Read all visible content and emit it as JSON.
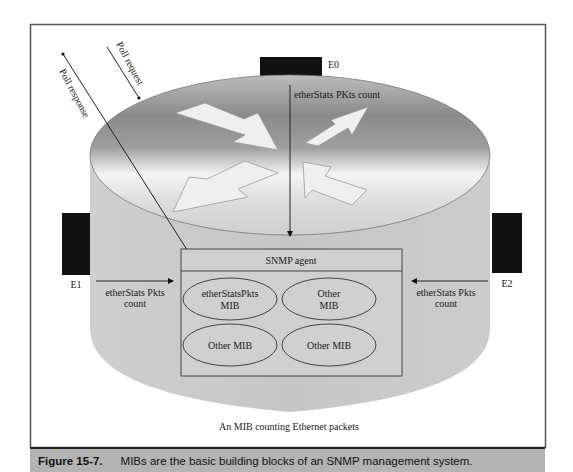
{
  "figure": {
    "number_label": "Figure 15-7.",
    "caption": "MIBs are the basic building blocks of an SNMP management system.",
    "subtitle": "An MIB counting Ethernet packets"
  },
  "interfaces": {
    "e0": "E0",
    "e1": "E1",
    "e2": "E2"
  },
  "arrows": {
    "poll_request": "Poll request",
    "poll_response": "Poll response",
    "top_count": "etherStats PKts count",
    "left_count_line1": "etherStats Pkts",
    "left_count_line2": "count",
    "right_count_line1": "etherStats Pkts",
    "right_count_line2": "count"
  },
  "agent": {
    "title": "SNMP agent",
    "mibs": [
      {
        "line1": "etherStatsPkts",
        "line2": "MIB"
      },
      {
        "line1": "Other",
        "line2": "MIB"
      },
      {
        "line1": "Other MIB",
        "line2": ""
      },
      {
        "line1": "Other MIB",
        "line2": ""
      }
    ]
  },
  "colors": {
    "frame": "#555555",
    "caption_bar": "#b3b3b3",
    "cylinder_body": "#c8c8c8",
    "port_block": "#111111",
    "arrow_fill": "#efefef"
  }
}
